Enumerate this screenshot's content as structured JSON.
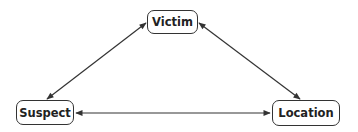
{
  "diagram": {
    "type": "triangle relationship diagram",
    "nodes": [
      {
        "id": "victim",
        "label": "Victim"
      },
      {
        "id": "suspect",
        "label": "Suspect"
      },
      {
        "id": "location",
        "label": "Location"
      }
    ],
    "edges": [
      {
        "from": "suspect",
        "to": "victim",
        "direction": "bidirectional"
      },
      {
        "from": "victim",
        "to": "location",
        "direction": "bidirectional"
      },
      {
        "from": "suspect",
        "to": "location",
        "direction": "bidirectional"
      }
    ],
    "colors": {
      "stroke": "#333333",
      "background": "#ffffff",
      "text": "#222222"
    }
  }
}
